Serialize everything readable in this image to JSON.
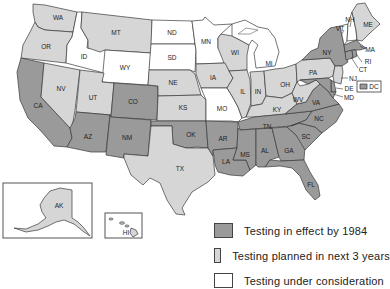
{
  "colors": {
    "in_effect": "#9a9a9a",
    "planned": "#d6d6d6",
    "consideration": "#ffffff",
    "border": "#3a3a3a"
  },
  "legend": {
    "items": [
      {
        "key": "in_effect",
        "label": "Testing in effect by 1984"
      },
      {
        "key": "planned",
        "label": "Testing planned in next 3 years"
      },
      {
        "key": "consideration",
        "label": "Testing under consideration"
      }
    ]
  },
  "states": {
    "WA": "planned",
    "OR": "planned",
    "CA": "in_effect",
    "ID": "consideration",
    "NV": "planned",
    "MT": "planned",
    "WY": "consideration",
    "UT": "planned",
    "AZ": "in_effect",
    "CO": "in_effect",
    "NM": "in_effect",
    "ND": "consideration",
    "SD": "consideration",
    "NE": "planned",
    "KS": "planned",
    "OK": "in_effect",
    "TX": "planned",
    "MN": "consideration",
    "IA": "planned",
    "MO": "consideration",
    "AR": "in_effect",
    "LA": "in_effect",
    "WI": "planned",
    "IL": "planned",
    "MI": "consideration",
    "IN": "planned",
    "OH": "planned",
    "KY": "planned",
    "TN": "in_effect",
    "MS": "in_effect",
    "AL": "in_effect",
    "GA": "in_effect",
    "FL": "in_effect",
    "SC": "in_effect",
    "NC": "in_effect",
    "VA": "in_effect",
    "WV": "planned",
    "PA": "planned",
    "NY": "in_effect",
    "VT": "consideration",
    "NH": "consideration",
    "ME": "planned",
    "MA": "in_effect",
    "RI": "in_effect",
    "CT": "in_effect",
    "NJ": "planned",
    "DE": "in_effect",
    "MD": "in_effect",
    "DC": "in_effect",
    "AK": "planned",
    "HI": "planned"
  },
  "labels": {
    "WA": "WA",
    "OR": "OR",
    "CA": "CA",
    "ID": "ID",
    "NV": "NV",
    "MT": "MT",
    "WY": "WY",
    "UT": "UT",
    "AZ": "AZ",
    "CO": "CO",
    "NM": "NM",
    "ND": "ND",
    "SD": "SD",
    "NE": "NE",
    "KS": "KS",
    "OK": "OK",
    "TX": "TX",
    "MN": "MN",
    "IA": "IA",
    "MO": "MO",
    "AR": "AR",
    "LA": "LA",
    "WI": "WI",
    "IL": "IL",
    "MI": "MI",
    "IN": "IN",
    "OH": "OH",
    "KY": "KY",
    "TN": "TN",
    "MS": "MS",
    "AL": "AL",
    "GA": "GA",
    "FL": "FL",
    "SC": "SC",
    "NC": "NC",
    "VA": "VA",
    "WV": "WV",
    "PA": "PA",
    "NY": "NY",
    "VT": "VT",
    "NH": "NH",
    "ME": "ME",
    "MA": "MA",
    "RI": "RI",
    "CT": "CT",
    "NJ": "NJ",
    "DE": "DE",
    "MD": "MD",
    "DC": "DC",
    "AK": "AK",
    "HI": "HI"
  }
}
